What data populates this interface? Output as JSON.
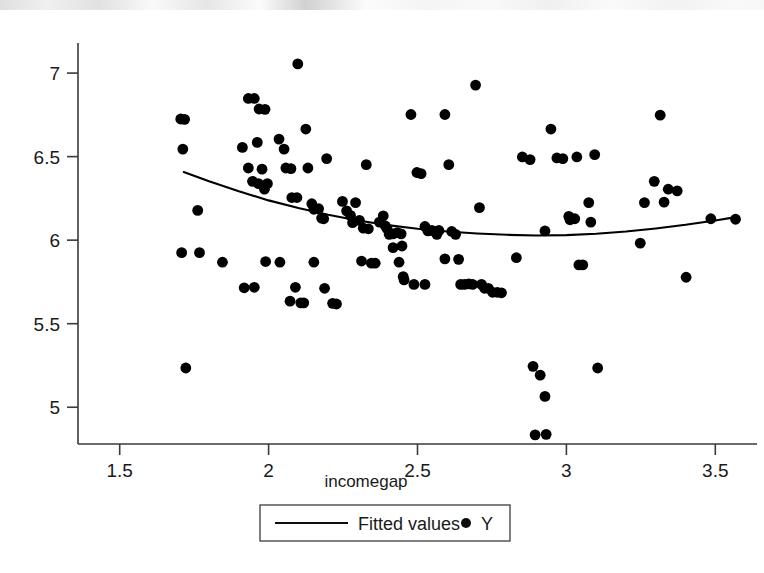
{
  "chart_data": {
    "type": "scatter",
    "title": "",
    "subtitle": "",
    "xlabel": "incomegap",
    "ylabel": "",
    "xlim": [
      1.36,
      3.64
    ],
    "ylim": [
      4.78,
      7.18
    ],
    "xticks": [
      1.5,
      2,
      2.5,
      3,
      3.5
    ],
    "xtick_labels": [
      "1.5",
      "2",
      "2.5",
      "3",
      "3.5"
    ],
    "yticks": [
      5,
      5.5,
      6,
      6.5,
      7
    ],
    "ytick_labels": [
      "5",
      "5.5",
      "6",
      "6.5",
      "7"
    ],
    "grid": false,
    "legend_position": "below-axes-center",
    "legend": [
      {
        "label": "Fitted values",
        "marker": "line",
        "color": "#000000"
      },
      {
        "label": "Y",
        "marker": "dot",
        "color": "#000000"
      }
    ],
    "series": [
      {
        "name": "Y",
        "type": "scatter",
        "marker": "filled-circle",
        "color": "#000000",
        "points": [
          [
            1.705,
            6.725
          ],
          [
            1.718,
            6.723
          ],
          [
            1.712,
            6.545
          ],
          [
            1.708,
            5.925
          ],
          [
            1.768,
            5.925
          ],
          [
            1.762,
            6.178
          ],
          [
            1.722,
            5.235
          ],
          [
            1.932,
            6.848
          ],
          [
            1.952,
            6.848
          ],
          [
            1.968,
            6.785
          ],
          [
            1.988,
            6.783
          ],
          [
            1.912,
            6.555
          ],
          [
            1.962,
            6.585
          ],
          [
            1.932,
            6.432
          ],
          [
            1.946,
            6.352
          ],
          [
            1.978,
            6.425
          ],
          [
            1.996,
            6.338
          ],
          [
            1.966,
            6.338
          ],
          [
            1.986,
            6.305
          ],
          [
            1.918,
            5.715
          ],
          [
            1.952,
            5.718
          ],
          [
            1.99,
            5.872
          ],
          [
            2.035,
            6.605
          ],
          [
            2.052,
            6.545
          ],
          [
            2.058,
            6.432
          ],
          [
            2.075,
            6.428
          ],
          [
            2.078,
            6.255
          ],
          [
            2.095,
            6.255
          ],
          [
            2.098,
            7.055
          ],
          [
            2.038,
            5.868
          ],
          [
            2.072,
            5.635
          ],
          [
            2.09,
            5.718
          ],
          [
            2.108,
            5.625
          ],
          [
            2.118,
            5.625
          ],
          [
            2.125,
            6.665
          ],
          [
            2.132,
            6.432
          ],
          [
            2.145,
            6.218
          ],
          [
            2.152,
            6.185
          ],
          [
            2.168,
            6.188
          ],
          [
            2.178,
            6.132
          ],
          [
            2.185,
            6.128
          ],
          [
            2.195,
            6.488
          ],
          [
            2.188,
            5.712
          ],
          [
            2.215,
            5.622
          ],
          [
            2.228,
            5.618
          ],
          [
            2.248,
            6.232
          ],
          [
            2.262,
            6.175
          ],
          [
            2.275,
            6.148
          ],
          [
            2.282,
            6.105
          ],
          [
            2.292,
            6.225
          ],
          [
            2.305,
            6.118
          ],
          [
            2.318,
            6.072
          ],
          [
            2.328,
            6.452
          ],
          [
            2.335,
            6.068
          ],
          [
            2.312,
            5.875
          ],
          [
            2.345,
            5.862
          ],
          [
            2.358,
            5.862
          ],
          [
            2.372,
            6.108
          ],
          [
            2.385,
            6.145
          ],
          [
            2.392,
            6.085
          ],
          [
            2.398,
            6.068
          ],
          [
            2.405,
            6.035
          ],
          [
            2.418,
            6.038
          ],
          [
            2.432,
            6.045
          ],
          [
            2.445,
            6.038
          ],
          [
            2.438,
            5.868
          ],
          [
            2.452,
            5.782
          ],
          [
            2.455,
            5.762
          ],
          [
            2.478,
            6.752
          ],
          [
            2.498,
            6.405
          ],
          [
            2.512,
            6.398
          ],
          [
            2.525,
            6.082
          ],
          [
            2.535,
            6.055
          ],
          [
            2.548,
            6.058
          ],
          [
            2.558,
            6.052
          ],
          [
            2.565,
            6.035
          ],
          [
            2.572,
            6.058
          ],
          [
            2.488,
            5.735
          ],
          [
            2.525,
            5.735
          ],
          [
            2.592,
            6.752
          ],
          [
            2.605,
            6.452
          ],
          [
            2.615,
            6.052
          ],
          [
            2.628,
            6.035
          ],
          [
            2.638,
            5.885
          ],
          [
            2.645,
            5.735
          ],
          [
            2.658,
            5.735
          ],
          [
            2.672,
            5.738
          ],
          [
            2.685,
            5.735
          ],
          [
            2.695,
            6.928
          ],
          [
            2.708,
            6.195
          ],
          [
            2.715,
            5.735
          ],
          [
            2.725,
            5.712
          ],
          [
            2.738,
            5.712
          ],
          [
            2.752,
            5.688
          ],
          [
            2.768,
            5.688
          ],
          [
            2.782,
            5.685
          ],
          [
            2.852,
            6.498
          ],
          [
            2.878,
            6.482
          ],
          [
            2.888,
            5.245
          ],
          [
            2.895,
            4.835
          ],
          [
            2.912,
            5.192
          ],
          [
            2.928,
            5.065
          ],
          [
            2.932,
            4.838
          ],
          [
            2.928,
            6.055
          ],
          [
            2.948,
            6.665
          ],
          [
            2.968,
            6.492
          ],
          [
            2.988,
            6.488
          ],
          [
            3.008,
            6.142
          ],
          [
            3.012,
            6.122
          ],
          [
            3.028,
            6.128
          ],
          [
            3.035,
            6.498
          ],
          [
            3.042,
            5.852
          ],
          [
            3.055,
            5.852
          ],
          [
            3.075,
            6.225
          ],
          [
            3.082,
            6.108
          ],
          [
            3.095,
            6.512
          ],
          [
            3.105,
            5.235
          ],
          [
            3.248,
            5.982
          ],
          [
            3.262,
            6.225
          ],
          [
            3.295,
            6.352
          ],
          [
            3.315,
            6.748
          ],
          [
            3.328,
            6.228
          ],
          [
            3.342,
            6.305
          ],
          [
            3.372,
            6.295
          ],
          [
            3.402,
            5.778
          ],
          [
            3.485,
            6.128
          ],
          [
            3.568,
            6.125
          ],
          [
            1.845,
            5.868
          ],
          [
            2.152,
            5.868
          ],
          [
            2.448,
            5.965
          ],
          [
            2.418,
            5.955
          ],
          [
            2.592,
            5.888
          ],
          [
            2.832,
            5.895
          ]
        ]
      },
      {
        "name": "Fitted values",
        "type": "line",
        "color": "#000000",
        "points": [
          [
            1.715,
            6.408
          ],
          [
            1.8,
            6.352
          ],
          [
            1.9,
            6.292
          ],
          [
            2.0,
            6.238
          ],
          [
            2.1,
            6.192
          ],
          [
            2.2,
            6.152
          ],
          [
            2.3,
            6.118
          ],
          [
            2.4,
            6.09
          ],
          [
            2.5,
            6.068
          ],
          [
            2.6,
            6.052
          ],
          [
            2.7,
            6.04
          ],
          [
            2.8,
            6.032
          ],
          [
            2.9,
            6.028
          ],
          [
            3.0,
            6.03
          ],
          [
            3.1,
            6.038
          ],
          [
            3.2,
            6.052
          ],
          [
            3.3,
            6.07
          ],
          [
            3.4,
            6.092
          ],
          [
            3.5,
            6.118
          ],
          [
            3.568,
            6.138
          ]
        ]
      }
    ]
  },
  "axes": {
    "x_axis_name": "x-axis",
    "y_axis_name": "y-axis"
  }
}
